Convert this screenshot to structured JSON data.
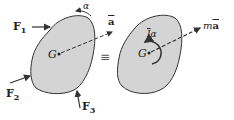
{
  "diagram": {
    "type": "free-body / kinetic diagram equivalence",
    "left": {
      "center_label": "G",
      "forces": [
        {
          "name": "F",
          "sub": "1"
        },
        {
          "name": "F",
          "sub": "2"
        },
        {
          "name": "F",
          "sub": "3"
        }
      ],
      "angular_accel_label": "α",
      "accel_label": "a"
    },
    "equivalence": "≡",
    "right": {
      "center_label": "G",
      "moment_label": "Īα",
      "moment_I": "I",
      "moment_alpha": "α",
      "inertia_force_label": "m",
      "inertia_accel": "a"
    },
    "colors": {
      "body_fill": "#d4d4d4",
      "body_stroke": "#333333",
      "arrow": "#333333"
    }
  }
}
